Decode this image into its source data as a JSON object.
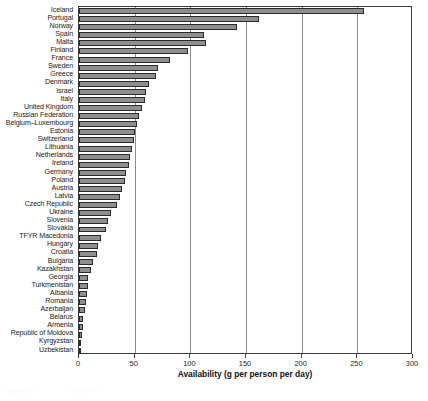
{
  "chart_data": {
    "type": "bar",
    "orientation": "horizontal",
    "title": "",
    "xlabel": "Availability (g per person per day)",
    "ylabel": "",
    "xlim": [
      0,
      300
    ],
    "xticks": [
      0,
      50,
      100,
      150,
      200,
      250,
      300
    ],
    "xtick_labels": [
      "0",
      "50",
      "100",
      "150",
      "200",
      "250",
      "300"
    ],
    "grid": true,
    "grid_axis": "x",
    "legend": null,
    "bar_color": "#8e8e8e",
    "bar_edge_color": "#2b2b2b",
    "categories": [
      "Iceland",
      "Portugal",
      "Norway",
      "Spain",
      "Malta",
      "Finland",
      "France",
      "Sweden",
      "Greece",
      "Denmark",
      "Israel",
      "Italy",
      "United Kingdom",
      "Russian Federation",
      "Belgium–Luxembourg",
      "Estonia",
      "Switzerland",
      "Lithuania",
      "Netherlands",
      "Ireland",
      "Germany",
      "Poland",
      "Austria",
      "Latvia",
      "Czech Republic",
      "Ukraine",
      "Slovenia",
      "Slovakia",
      "TFYR Macedonia",
      "Hungary",
      "Croatia",
      "Bulgaria",
      "Kazakhstan",
      "Georgia",
      "Turkmenistan",
      "Albania",
      "Romania",
      "Azerbaijan",
      "Belarus",
      "Armenia",
      "Republic of Moldova",
      "Kyrgyzstan",
      "Uzbekistan"
    ],
    "values": [
      256,
      162,
      142,
      112,
      114,
      98,
      82,
      71,
      69,
      63,
      60,
      59,
      57,
      54,
      52,
      50,
      49,
      48,
      46,
      45,
      42,
      41,
      39,
      37,
      34,
      29,
      26,
      24,
      20,
      17,
      16,
      13,
      11,
      8,
      8,
      7,
      6,
      5,
      4,
      4,
      3,
      2,
      1
    ]
  }
}
